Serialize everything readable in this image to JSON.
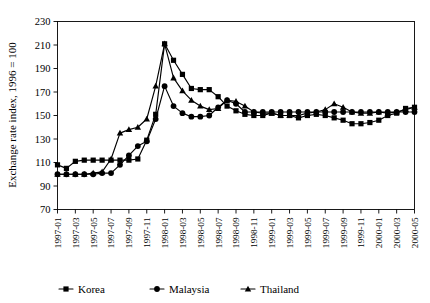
{
  "chart_data": {
    "type": "line",
    "title": "",
    "xlabel": "",
    "ylabel": "Exchange rate index, 1996 = 100",
    "ylim": [
      70,
      230
    ],
    "ytick_step": 20,
    "yticks": [
      70,
      90,
      110,
      130,
      150,
      170,
      190,
      210,
      230
    ],
    "grid": false,
    "legend_position": "bottom",
    "x": [
      "1997-01",
      "1997-02",
      "1997-03",
      "1997-04",
      "1997-05",
      "1997-06",
      "1997-07",
      "1997-08",
      "1997-09",
      "1997-10",
      "1997-11",
      "1997-12",
      "1998-01",
      "1998-02",
      "1998-03",
      "1998-04",
      "1998-05",
      "1998-06",
      "1998-07",
      "1998-08",
      "1998-09",
      "1998-10",
      "1998-11",
      "1998-12",
      "1999-01",
      "1999-02",
      "1999-03",
      "1999-04",
      "1999-05",
      "1999-06",
      "1999-07",
      "1999-08",
      "1999-09",
      "1999-10",
      "1999-11",
      "1999-12",
      "2000-01",
      "2000-02",
      "2000-03",
      "2000-04",
      "2000-05"
    ],
    "xtick_labels": [
      "1997-01",
      "1997-03",
      "1997-05",
      "1997-07",
      "1997-09",
      "1997-11",
      "1998-01",
      "1998-03",
      "1998-05",
      "1998-07",
      "1998-09",
      "1998-11",
      "1999-01",
      "1999-03",
      "1999-05",
      "1999-07",
      "1999-09",
      "1999-11",
      "2000-01",
      "2000-03",
      "2000-05"
    ],
    "series": [
      {
        "name": "Korea",
        "marker": "square",
        "values": [
          108,
          105,
          111,
          112,
          112,
          112,
          112,
          112,
          112,
          113,
          129,
          151,
          211,
          197,
          185,
          173,
          172,
          172,
          166,
          158,
          154,
          151,
          150,
          150,
          152,
          150,
          150,
          148,
          150,
          151,
          150,
          148,
          146,
          143,
          143,
          144,
          146,
          150,
          152,
          156,
          157
        ]
      },
      {
        "name": "Malaysia",
        "marker": "circle",
        "values": [
          100,
          100,
          100,
          100,
          100,
          101,
          101,
          108,
          116,
          124,
          128,
          147,
          175,
          158,
          152,
          149,
          149,
          150,
          157,
          163,
          160,
          153,
          153,
          153,
          153,
          153,
          153,
          153,
          153,
          153,
          153,
          153,
          153,
          153,
          153,
          153,
          153,
          153,
          153,
          153,
          153
        ]
      },
      {
        "name": "Thailand",
        "marker": "triangle",
        "values": [
          100,
          100,
          100,
          100,
          101,
          102,
          113,
          135,
          138,
          140,
          147,
          175,
          211,
          182,
          171,
          163,
          158,
          155,
          156,
          163,
          162,
          158,
          153,
          152,
          152,
          150,
          150,
          150,
          152,
          153,
          155,
          160,
          157,
          153,
          152,
          152,
          153,
          152,
          153,
          155,
          157
        ]
      }
    ]
  },
  "legend": {
    "items": [
      {
        "label": "Korea",
        "marker": "square"
      },
      {
        "label": "Malaysia",
        "marker": "circle"
      },
      {
        "label": "Thailand",
        "marker": "triangle"
      }
    ]
  }
}
